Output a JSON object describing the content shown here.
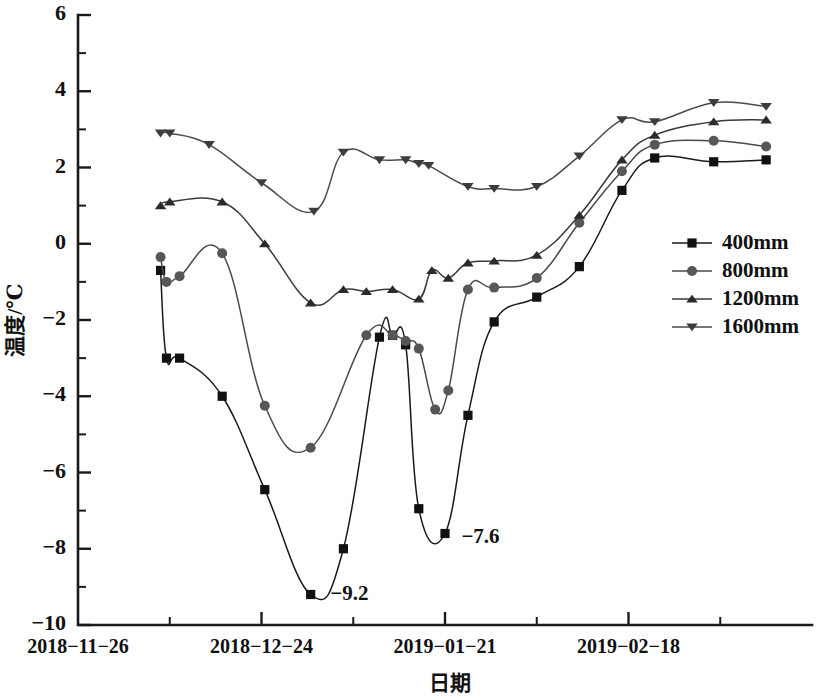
{
  "chart_data": {
    "type": "line",
    "title": "",
    "xlabel": "日期",
    "ylabel": "温度/℃",
    "ylim": [
      -10,
      6
    ],
    "ytick_labels": [
      "6",
      "4",
      "2",
      "0",
      "-2",
      "-4",
      "-6",
      "-8",
      "-10"
    ],
    "ytick_values": [
      6,
      4,
      2,
      0,
      -2,
      -4,
      -6,
      -8,
      -10
    ],
    "yminor_values": [
      5,
      3,
      1,
      -1,
      -3,
      -5,
      -7,
      -9
    ],
    "xtick_labels": [
      "2018-11-26",
      "2018-12-24",
      "2019-01-21",
      "2019-02-18"
    ],
    "xtick_days": [
      0,
      28,
      56,
      84
    ],
    "xminor_days": [
      14,
      42,
      70,
      98
    ],
    "xlim_days": [
      0,
      112
    ],
    "grid": false,
    "legend_position": "right-middle",
    "series": [
      {
        "name": "400mm",
        "marker": "square",
        "color": "#1a1a1a",
        "marker_color": "#111111",
        "x": [
          12.6,
          13.5,
          15.5,
          22.0,
          28.5,
          35.5,
          40.5,
          46.0,
          48.0,
          50.0,
          52.0,
          56.0,
          59.5,
          63.5,
          70.0,
          76.5,
          83.0,
          88.0,
          97.0,
          105.0
        ],
        "values": [
          -0.7,
          -3.0,
          -3.0,
          -4.0,
          -6.45,
          -9.2,
          -8.0,
          -2.45,
          -2.4,
          -2.65,
          -6.95,
          -7.6,
          -4.5,
          -2.05,
          -1.4,
          -0.6,
          1.4,
          2.25,
          2.15,
          2.2
        ]
      },
      {
        "name": "800mm",
        "marker": "circle",
        "color": "#4a4a4a",
        "marker_color": "#575757",
        "x": [
          12.6,
          13.5,
          15.5,
          22.0,
          28.5,
          35.5,
          44.0,
          48.0,
          50.0,
          52.0,
          54.5,
          56.5,
          59.5,
          63.5,
          70.0,
          76.5,
          83.0,
          88.0,
          97.0,
          105.0
        ],
        "values": [
          -0.35,
          -1.0,
          -0.85,
          -0.25,
          -4.25,
          -5.35,
          -2.4,
          -2.4,
          -2.55,
          -2.75,
          -4.35,
          -3.85,
          -1.2,
          -1.15,
          -0.9,
          0.55,
          1.9,
          2.6,
          2.7,
          2.55
        ]
      },
      {
        "name": "1200mm",
        "marker": "triangle-up",
        "color": "#3a3a3a",
        "marker_color": "#2b2b2b",
        "x": [
          12.6,
          14.0,
          22.0,
          28.5,
          35.5,
          40.5,
          44.0,
          48.0,
          52.0,
          54.0,
          56.5,
          59.5,
          63.5,
          70.0,
          76.5,
          83.0,
          88.0,
          97.0,
          105.0
        ],
        "values": [
          1.0,
          1.1,
          1.1,
          0.0,
          -1.55,
          -1.2,
          -1.25,
          -1.2,
          -1.45,
          -0.7,
          -0.9,
          -0.5,
          -0.45,
          -0.3,
          0.75,
          2.2,
          2.85,
          3.2,
          3.25
        ]
      },
      {
        "name": "1600mm",
        "marker": "triangle-down",
        "color": "#4a4a4a",
        "marker_color": "#3c3c3c",
        "x": [
          12.6,
          14.0,
          20.0,
          28.0,
          36.0,
          40.5,
          46.0,
          50.0,
          52.0,
          53.5,
          59.5,
          63.5,
          70.0,
          76.5,
          83.0,
          88.0,
          97.0,
          105.0
        ],
        "values": [
          2.9,
          2.9,
          2.6,
          1.6,
          0.85,
          2.4,
          2.2,
          2.2,
          2.1,
          2.05,
          1.5,
          1.45,
          1.5,
          2.3,
          3.25,
          3.2,
          3.7,
          3.6
        ]
      }
    ],
    "annotations": [
      {
        "text": "-9.2",
        "x_day": 38.5,
        "value": -9.35
      },
      {
        "text": "-7.6",
        "x_day": 58.5,
        "value": -7.85
      }
    ]
  },
  "legend": {
    "items": [
      {
        "label": "400mm"
      },
      {
        "label": "800mm"
      },
      {
        "label": "1200mm"
      },
      {
        "label": "1600mm"
      }
    ]
  }
}
